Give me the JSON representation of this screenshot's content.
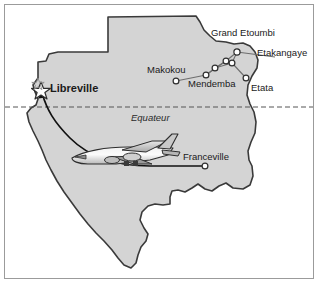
{
  "figure": {
    "frame_color": "#9b9b9b",
    "background_color": "#ffffff",
    "landmass_fill": "#d4d4d4",
    "landmass_stroke": "#3a3a3a",
    "equator_line_color": "#555555",
    "route_line_color": "#6e6e6e",
    "flight_path_color": "#111111",
    "node_fill": "#ffffff",
    "node_stroke": "#3a3a3a"
  },
  "equator": {
    "label": "Equateur"
  },
  "capital": {
    "name": "Libreville",
    "marker": "star-marker"
  },
  "cities": [
    {
      "name": "Grand Etoumbi",
      "marker": "circle-marker"
    },
    {
      "name": "Etakangaye",
      "marker": "circle-marker"
    },
    {
      "name": "Makokou",
      "marker": "circle-marker"
    },
    {
      "name": "Mendemba",
      "marker": "circle-marker"
    },
    {
      "name": "Etata",
      "marker": "circle-marker"
    },
    {
      "name": "Franceville",
      "marker": "circle-marker"
    }
  ],
  "aircraft": {
    "name": "airplane-icon"
  }
}
